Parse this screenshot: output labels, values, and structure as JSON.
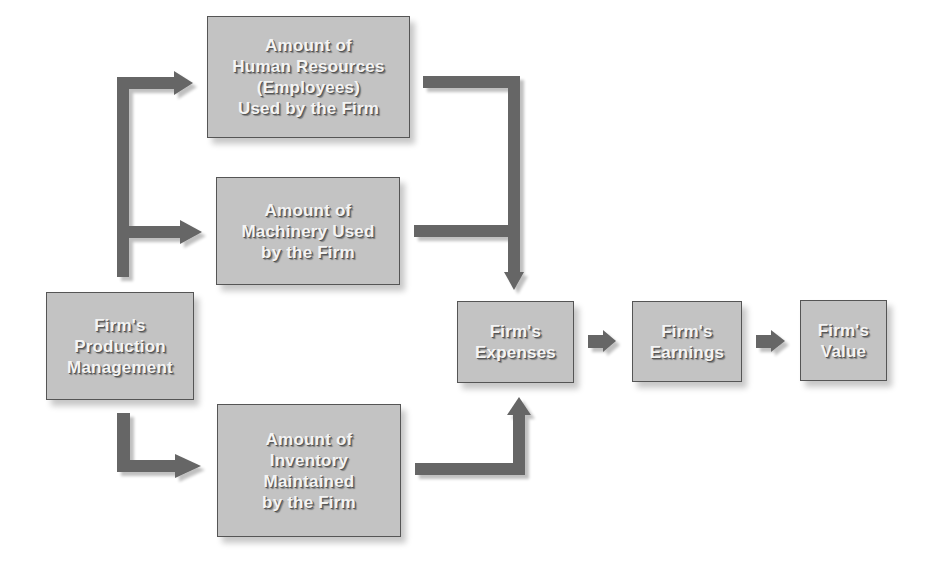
{
  "diagram": {
    "type": "flowchart",
    "nodes": {
      "production": {
        "lines": [
          "Firm's",
          "Production",
          "Management"
        ]
      },
      "human_resources": {
        "lines": [
          "Amount of",
          "Human Resources",
          "(Employees)",
          "Used by the Firm"
        ]
      },
      "machinery": {
        "lines": [
          "Amount of",
          "Machinery Used",
          "by the Firm"
        ]
      },
      "inventory": {
        "lines": [
          "Amount of",
          "Inventory",
          "Maintained",
          "by the Firm"
        ]
      },
      "expenses": {
        "lines": [
          "Firm's",
          "Expenses"
        ]
      },
      "earnings": {
        "lines": [
          "Firm's",
          "Earnings"
        ]
      },
      "value": {
        "lines": [
          "Firm's",
          "Value"
        ]
      }
    },
    "edges": [
      {
        "from": "production",
        "to": "human_resources"
      },
      {
        "from": "production",
        "to": "machinery"
      },
      {
        "from": "production",
        "to": "inventory"
      },
      {
        "from": "human_resources",
        "to": "expenses"
      },
      {
        "from": "machinery",
        "to": "expenses"
      },
      {
        "from": "inventory",
        "to": "expenses"
      },
      {
        "from": "expenses",
        "to": "earnings"
      },
      {
        "from": "earnings",
        "to": "value"
      }
    ],
    "colors": {
      "box_fill": "#c3c3c3",
      "box_border": "#555555",
      "arrow": "#666666",
      "text": "#f4f4f4"
    }
  }
}
